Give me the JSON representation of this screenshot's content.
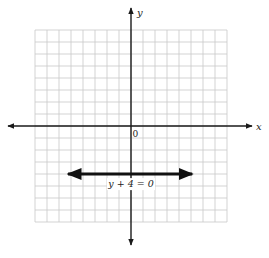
{
  "chart_data": {
    "type": "line",
    "title": "",
    "xlabel": "x",
    "ylabel": "y",
    "origin_label": "0",
    "xlim": [
      -8,
      8
    ],
    "ylim": [
      -8,
      8
    ],
    "grid": true,
    "grid_step": 1,
    "series": [
      {
        "name": "y + 4 = 0",
        "equation": "y + 4 = 0",
        "kind": "horizontal line with arrows",
        "y": -4,
        "x": [
          -5.25,
          5.1
        ],
        "values": [
          -4,
          -4
        ]
      }
    ],
    "annotations": [
      {
        "text": "y + 4 = 0",
        "x": 0,
        "y": -4.8
      }
    ]
  },
  "labels": {
    "x_axis": "x",
    "y_axis": "y",
    "origin": "0",
    "equation": "y + 4 = 0"
  },
  "colors": {
    "grid": "#c8c8c8",
    "axis": "#1a1a1a",
    "line": "#111111",
    "background": "#ffffff"
  }
}
